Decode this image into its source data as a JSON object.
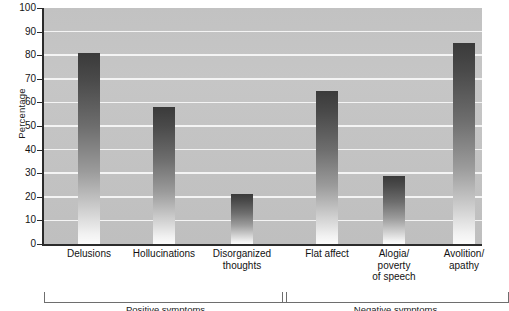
{
  "chart_data": {
    "type": "bar",
    "title": "",
    "subtitle": "",
    "xlabel": "",
    "ylabel": "Percentage",
    "ylim": [
      0,
      100
    ],
    "ytick_step": 10,
    "yticks": [
      0,
      10,
      20,
      30,
      40,
      50,
      60,
      70,
      80,
      90,
      100
    ],
    "ytick_labels": [
      "0",
      "10",
      "20",
      "30",
      "40",
      "50",
      "60",
      "70",
      "80",
      "90",
      "100"
    ],
    "grid": "horizontal",
    "legend": "none",
    "categories": [
      "Delusions",
      "Hollucinations",
      "Disorganized thoughts",
      "Flat affect",
      "Alogia/ poverty of speech",
      "Avolition/ apathy"
    ],
    "values": [
      81,
      58,
      21,
      65,
      29,
      85
    ],
    "bars": [
      {
        "label_lines": [
          "Delusions"
        ],
        "value": 81,
        "group": "positive"
      },
      {
        "label_lines": [
          "Hollucinations"
        ],
        "value": 58,
        "group": "positive"
      },
      {
        "label_lines": [
          "Disorganized",
          "thoughts"
        ],
        "value": 21,
        "group": "positive"
      },
      {
        "label_lines": [
          "Flat affect"
        ],
        "value": 65,
        "group": "negative"
      },
      {
        "label_lines": [
          "Alogia/",
          "poverty",
          "of speech"
        ],
        "value": 29,
        "group": "negative"
      },
      {
        "label_lines": [
          "Avolition/",
          "apathy"
        ],
        "value": 85,
        "group": "negative"
      }
    ],
    "groups": [
      {
        "name": "positive",
        "caption": "Positive symptoms",
        "from_bar": 0,
        "to_bar": 2
      },
      {
        "name": "negative",
        "caption": "Negative symptoms",
        "from_bar": 3,
        "to_bar": 5
      }
    ],
    "colors": {
      "plot_background": "#c4c4c4",
      "gridline": "#f4f4f4",
      "bar_top": "#3a3a3a",
      "bar_bottom": "#fbfbfb",
      "axis": "#2b2b2b",
      "text": "#141414",
      "bracket": "#6e6e6e",
      "page_background": "#ffffff"
    }
  }
}
